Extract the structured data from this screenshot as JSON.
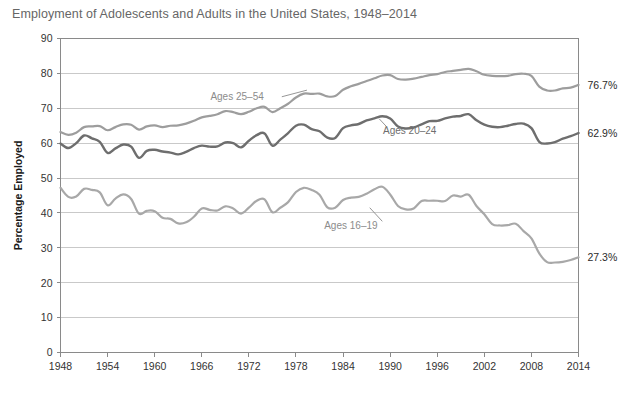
{
  "chart_data": {
    "type": "line",
    "title": "Employment of Adolescents and Adults in the United States, 1948–2014",
    "xlabel": "",
    "ylabel": "Percentage Employed",
    "xlim": [
      1948,
      2014
    ],
    "ylim": [
      0,
      90
    ],
    "grid": true,
    "legend_position": "inline-annotations",
    "y_ticks": [
      "0",
      "10",
      "20",
      "30",
      "40",
      "50",
      "60",
      "70",
      "80",
      "90"
    ],
    "y_tick_values": [
      0,
      10,
      20,
      30,
      40,
      50,
      60,
      70,
      80,
      90
    ],
    "x_ticks": [
      "1948",
      "1954",
      "1960",
      "1966",
      "1972",
      "1978",
      "1984",
      "1990",
      "1996",
      "2002",
      "2008",
      "2014"
    ],
    "x_tick_values": [
      1948,
      1954,
      1960,
      1966,
      1972,
      1978,
      1984,
      1990,
      1996,
      2002,
      2008,
      2014
    ],
    "annotations": [
      {
        "text": "Ages 25–54",
        "x": 1970.5,
        "y": 73.5
      },
      {
        "text": "Ages 20–24",
        "x": 1992.5,
        "y": 63.5
      },
      {
        "text": "Ages 16–19",
        "x": 1985.0,
        "y": 36.5
      }
    ],
    "end_labels": [
      {
        "text": "76.7%",
        "series": "Ages 25–54",
        "value": 76.7
      },
      {
        "text": "62.9%",
        "series": "Ages 20–24",
        "value": 62.9
      },
      {
        "text": "27.3%",
        "series": "Ages 16–19",
        "value": 27.3
      }
    ],
    "x": [
      1948,
      1949,
      1950,
      1951,
      1952,
      1953,
      1954,
      1955,
      1956,
      1957,
      1958,
      1959,
      1960,
      1961,
      1962,
      1963,
      1964,
      1965,
      1966,
      1967,
      1968,
      1969,
      1970,
      1971,
      1972,
      1973,
      1974,
      1975,
      1976,
      1977,
      1978,
      1979,
      1980,
      1981,
      1982,
      1983,
      1984,
      1985,
      1986,
      1987,
      1988,
      1989,
      1990,
      1991,
      1992,
      1993,
      1994,
      1995,
      1996,
      1997,
      1998,
      1999,
      2000,
      2001,
      2002,
      2003,
      2004,
      2005,
      2006,
      2007,
      2008,
      2009,
      2010,
      2011,
      2012,
      2013,
      2014
    ],
    "series": [
      {
        "name": "Ages 25–54",
        "color": "#9d9d9d",
        "values": [
          63.2,
          62.4,
          63.0,
          64.6,
          64.8,
          64.9,
          63.7,
          64.6,
          65.4,
          65.3,
          63.9,
          64.8,
          65.1,
          64.6,
          65.0,
          65.1,
          65.6,
          66.4,
          67.4,
          67.8,
          68.3,
          69.2,
          68.9,
          68.3,
          69.0,
          70.0,
          70.4,
          68.9,
          70.0,
          71.3,
          73.1,
          74.2,
          74.1,
          74.2,
          73.4,
          73.5,
          75.3,
          76.3,
          77.0,
          77.8,
          78.6,
          79.4,
          79.5,
          78.4,
          78.2,
          78.5,
          79.0,
          79.5,
          79.8,
          80.4,
          80.7,
          81.0,
          81.3,
          80.6,
          79.6,
          79.3,
          79.2,
          79.3,
          79.8,
          79.9,
          79.3,
          76.2,
          75.1,
          75.1,
          75.7,
          75.9,
          76.7
        ]
      },
      {
        "name": "Ages 20–24",
        "color": "#6e6e6e",
        "values": [
          59.9,
          58.6,
          60.0,
          62.2,
          61.4,
          60.4,
          57.2,
          58.5,
          59.6,
          59.0,
          55.8,
          57.8,
          58.1,
          57.6,
          57.3,
          56.8,
          57.5,
          58.6,
          59.3,
          59.0,
          59.1,
          60.2,
          60.0,
          58.8,
          60.7,
          62.3,
          62.8,
          59.3,
          61.0,
          62.9,
          65.0,
          65.3,
          64.0,
          63.4,
          61.6,
          61.5,
          64.3,
          65.1,
          65.5,
          66.5,
          67.1,
          67.7,
          67.1,
          64.8,
          64.2,
          64.5,
          65.4,
          66.3,
          66.4,
          67.1,
          67.6,
          67.8,
          68.3,
          66.6,
          65.3,
          64.7,
          64.6,
          65.0,
          65.5,
          65.6,
          64.3,
          60.4,
          59.9,
          60.3,
          61.3,
          62.0,
          62.9
        ]
      },
      {
        "name": "Ages 16–19",
        "color": "#a8a8a8",
        "values": [
          47.2,
          44.6,
          44.7,
          46.9,
          46.6,
          45.9,
          42.2,
          44.1,
          45.3,
          44.0,
          39.8,
          40.6,
          40.5,
          38.6,
          38.3,
          37.0,
          37.3,
          38.9,
          41.3,
          40.9,
          40.7,
          41.9,
          41.3,
          39.8,
          41.5,
          43.5,
          43.9,
          40.2,
          41.5,
          43.1,
          46.0,
          47.2,
          46.6,
          45.2,
          41.6,
          41.5,
          43.7,
          44.4,
          44.6,
          45.5,
          46.8,
          47.5,
          45.3,
          42.0,
          41.0,
          41.3,
          43.4,
          43.5,
          43.5,
          43.4,
          45.0,
          44.7,
          45.2,
          42.0,
          39.6,
          36.8,
          36.4,
          36.5,
          36.9,
          34.8,
          32.7,
          28.4,
          25.9,
          25.8,
          26.0,
          26.5,
          27.3
        ]
      }
    ]
  }
}
